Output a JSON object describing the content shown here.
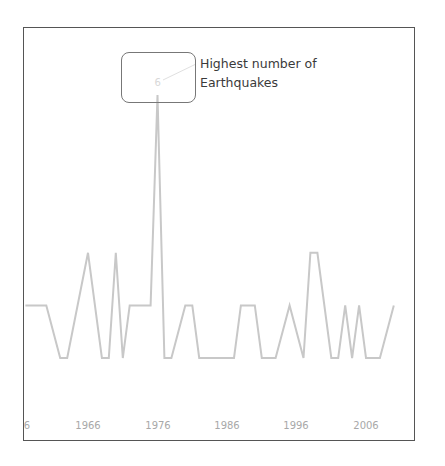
{
  "chart_data": {
    "type": "line",
    "title": "",
    "xlabel": "",
    "ylabel": "",
    "x_tick_labels": [
      "1956",
      "1966",
      "1976",
      "1986",
      "1996",
      "2006"
    ],
    "x_tick_visible_text": [
      "6",
      "1966",
      "1976",
      "1986",
      "1996",
      "2006"
    ],
    "x": [
      1957,
      1960,
      1962,
      1963,
      1966,
      1968,
      1969,
      1970,
      1971,
      1972,
      1975,
      1976,
      1977,
      1978,
      1980,
      1981,
      1982,
      1987,
      1988,
      1990,
      1991,
      1993,
      1995,
      1997,
      1998,
      1999,
      2001,
      2002,
      2003,
      2004,
      2005,
      2006,
      2008,
      2010
    ],
    "series": [
      {
        "name": "Number of Earthquakes",
        "values": [
          2,
          2,
          1,
          1,
          3,
          1,
          1,
          3,
          1,
          2,
          2,
          6,
          1,
          1,
          2,
          2,
          1,
          1,
          2,
          2,
          1,
          1,
          2,
          1,
          3,
          3,
          1,
          1,
          2,
          1,
          2,
          1,
          1,
          2
        ],
        "color": "#c8c8c8"
      }
    ],
    "ylim": [
      0,
      7
    ],
    "grid": false,
    "legend": null,
    "annotations": [
      {
        "x": 1976,
        "y": 6,
        "label": "6",
        "text": "Highest number of\nEarthquakes"
      }
    ]
  },
  "annotation": {
    "text": "Highest number of\nEarthquakes",
    "peak_value": "6"
  },
  "axis": {
    "ticks": [
      {
        "label": "6",
        "x": 27
      },
      {
        "label": "1966",
        "x": 88
      },
      {
        "label": "1976",
        "x": 158
      },
      {
        "label": "1986",
        "x": 227
      },
      {
        "label": "1996",
        "x": 296
      },
      {
        "label": "2006",
        "x": 366
      }
    ]
  },
  "colors": {
    "line": "#c8c8c8",
    "frame": "#555555",
    "annotation_text": "#3a3a3a",
    "tick_text": "#a8a8a8"
  }
}
